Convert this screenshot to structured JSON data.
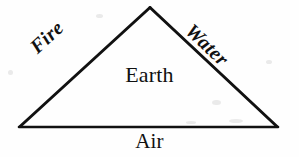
{
  "diagram": {
    "shape": "triangle",
    "stroke_color": "#111111",
    "background_color": "#fefefe",
    "canvas": {
      "width": 299,
      "height": 157
    },
    "vertices": {
      "apex": {
        "x": 150,
        "y": 7
      },
      "bottom_left": {
        "x": 20,
        "y": 127
      },
      "bottom_right": {
        "x": 277,
        "y": 127
      }
    },
    "labels": {
      "left_edge": "Fire",
      "right_edge": "Water",
      "interior": "Earth",
      "below_base": "Air"
    }
  }
}
